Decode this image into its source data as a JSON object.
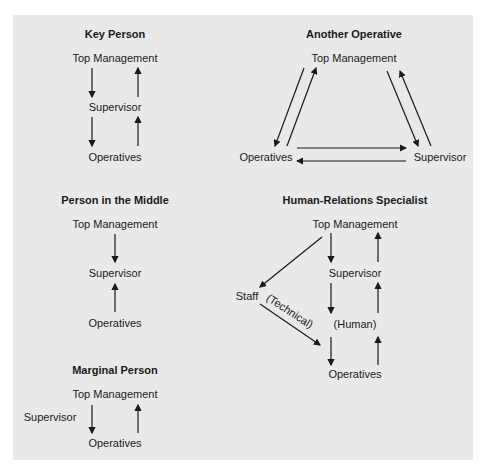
{
  "colors": {
    "panel": "#e9e9e9",
    "ink": "#1a1a1a"
  },
  "diagrams": {
    "key_person": {
      "title": "Key Person",
      "top": "Top Management",
      "middle": "Supervisor",
      "bottom": "Operatives"
    },
    "another_operative": {
      "title": "Another Operative",
      "top": "Top Management",
      "left": "Operatives",
      "right": "Supervisor"
    },
    "person_in_middle": {
      "title": "Person in the Middle",
      "top": "Top Management",
      "middle": "Supervisor",
      "bottom": "Operatives"
    },
    "human_relations": {
      "title": "Human-Relations Specialist",
      "top": "Top Management",
      "supervisor": "Supervisor",
      "staff": "Staff",
      "technical": "(Technical)",
      "human": "(Human)",
      "bottom": "Operatives"
    },
    "marginal_person": {
      "title": "Marginal Person",
      "top": "Top Management",
      "side": "Supervisor",
      "bottom": "Operatives"
    }
  }
}
